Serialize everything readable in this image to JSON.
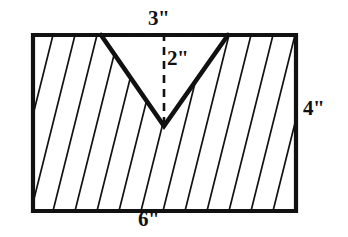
{
  "figure": {
    "kind": "engineering-drawing",
    "stroke_color": "#111111",
    "background_color": "#ffffff",
    "hatch_color": "#111111",
    "dimensions": {
      "notch_width": "3\"",
      "notch_depth": "2\"",
      "block_height": "4\"",
      "block_width": "6\""
    },
    "labels": [
      {
        "id": "top",
        "text": "3\"",
        "meaning": "width of V-notch opening at top"
      },
      {
        "id": "depth",
        "text": "2\"",
        "meaning": "vertical depth of V-notch"
      },
      {
        "id": "right",
        "text": "4\"",
        "meaning": "height of rectangular block"
      },
      {
        "id": "bottom",
        "text": "6\"",
        "meaning": "width of rectangular block"
      }
    ],
    "geometry": {
      "rect": {
        "left": 33,
        "top": 35,
        "right": 296,
        "bottom": 211
      },
      "notch": {
        "left_top": [
          101,
          35
        ],
        "apex": [
          164,
          126
        ],
        "right_top": [
          228,
          35
        ]
      },
      "dashed_top_line": {
        "from": [
          101,
          35
        ],
        "to": [
          228,
          35
        ]
      },
      "dashed_depth_line": {
        "from": [
          164,
          35
        ],
        "to": [
          164,
          126
        ]
      },
      "hatch": {
        "angle_deg": 76,
        "spacing_px": 22
      }
    }
  }
}
